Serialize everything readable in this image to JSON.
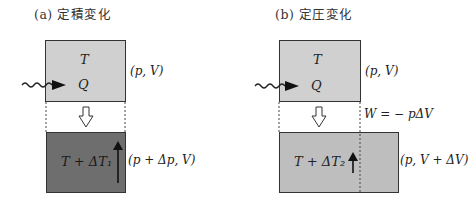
{
  "panel_a": {
    "title": "(a)  定積変化",
    "top_box": {
      "temp_label": "T",
      "heat_label": "Q",
      "state": "(p, V)"
    },
    "bottom_box": {
      "temp_label": "T + ΔT₁",
      "state": "(p + Δp, V)"
    }
  },
  "panel_b": {
    "title": "(b)  定圧変化",
    "top_box": {
      "temp_label": "T",
      "heat_label": "Q",
      "state": "(p, V)"
    },
    "work_label": "W = − pΔV",
    "bottom_box": {
      "temp_label": "T + ΔT₂",
      "state": "(p, V + ΔV)"
    }
  },
  "colors": {
    "light_fill": "#d0d0d0",
    "dark_fill": "#6e6e6e",
    "medium_fill": "#bebebe",
    "stroke": "#333333"
  }
}
